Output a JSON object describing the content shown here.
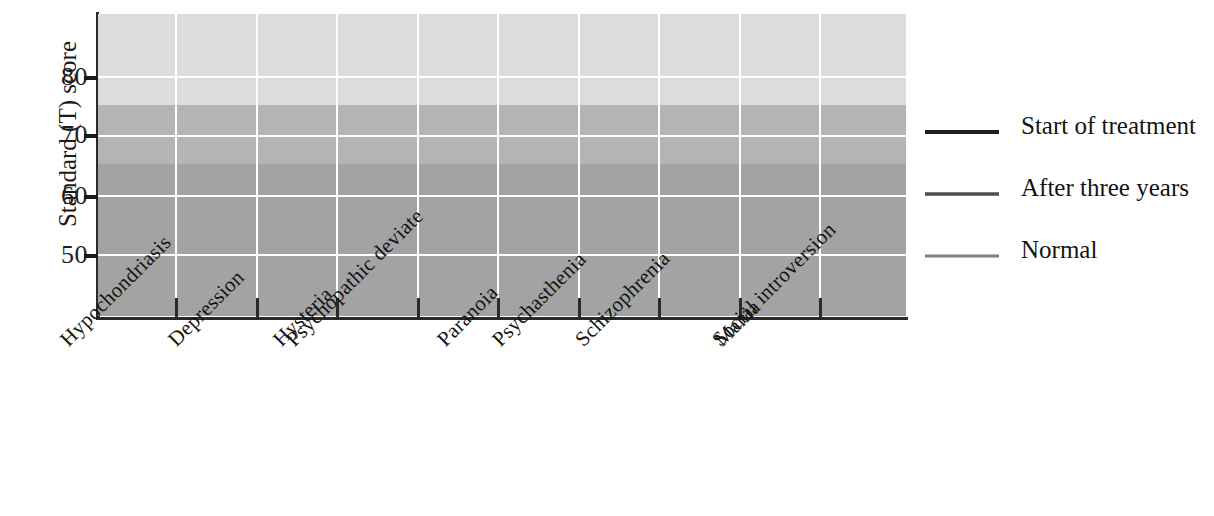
{
  "chart_data": {
    "type": "line",
    "title": "",
    "xlabel": "",
    "ylabel": "Standard (T) score",
    "categories": [
      "Hypochondriasis",
      "Depression",
      "Hysteria",
      "Psychopathic deviate",
      "Paranoia",
      "Psychasthenia",
      "Schizophrenia",
      "Mania",
      "Social introversion"
    ],
    "series": [
      {
        "name": "Start of treatment",
        "color": "#231f20",
        "width": 4.0,
        "values": [
          58,
          69,
          59.5,
          65,
          64,
          65.5,
          63,
          52,
          57
        ]
      },
      {
        "name": "After three years",
        "color": "#4d4d4d",
        "width": 3.4,
        "values": [
          52,
          52,
          53,
          55,
          57,
          55.5,
          53.5,
          49,
          51
        ]
      },
      {
        "name": "Normal",
        "color": "#808080",
        "width": 3.2,
        "values": [
          46,
          47,
          47,
          49,
          45,
          49,
          50,
          45,
          47
        ]
      }
    ],
    "ylim": [
      42,
      90
    ],
    "yticks": [
      50,
      60,
      70,
      80
    ],
    "ytick_labels": [
      "50",
      "60",
      "70",
      "80"
    ],
    "grid": true,
    "legend_position": "right",
    "bands": [
      {
        "from": 75,
        "to": 90,
        "color": "#dcdcdc"
      },
      {
        "from": 65,
        "to": 75,
        "color": "#b4b4b4"
      },
      {
        "from": 42,
        "to": 65,
        "color": "#a3a3a3"
      }
    ]
  },
  "legend": {
    "entries": [
      "Start of treatment",
      "After three years",
      "Normal"
    ]
  }
}
